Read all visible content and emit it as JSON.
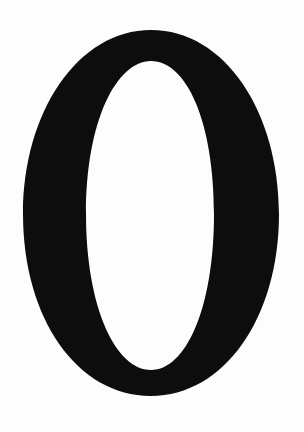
{
  "image": {
    "glyph": "0",
    "description": "Large black serif numeral zero on white background",
    "colors": {
      "background": "#fdfdfd",
      "glyph": "#0d0d0d"
    }
  }
}
